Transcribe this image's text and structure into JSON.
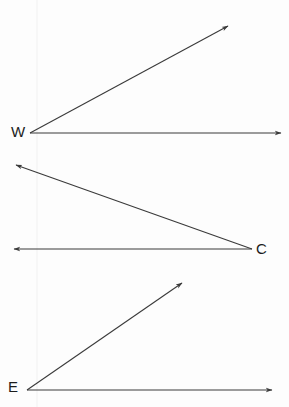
{
  "figure": {
    "background_color": "#fdfdfd",
    "stroke_color": "#3a3a3a",
    "label_color": "#1c1c1c",
    "width": 289,
    "height": 407
  },
  "angles": [
    {
      "id": "angle-w",
      "label": "W",
      "vertex": {
        "x": 30,
        "y": 133
      },
      "label_position": {
        "x": 11,
        "y": 124
      },
      "rays": [
        {
          "name": "upper-ray",
          "from": {
            "x": 30,
            "y": 133
          },
          "to": {
            "x": 228,
            "y": 26
          },
          "arrow_at": "to"
        },
        {
          "name": "horizontal-ray",
          "from": {
            "x": 30,
            "y": 133
          },
          "to": {
            "x": 281,
            "y": 133
          },
          "arrow_at": "to"
        }
      ]
    },
    {
      "id": "angle-c",
      "label": "C",
      "vertex": {
        "x": 252,
        "y": 249
      },
      "label_position": {
        "x": 256,
        "y": 241
      },
      "rays": [
        {
          "name": "upper-ray",
          "from": {
            "x": 252,
            "y": 249
          },
          "to": {
            "x": 16,
            "y": 165
          },
          "arrow_at": "to"
        },
        {
          "name": "horizontal-ray",
          "from": {
            "x": 252,
            "y": 249
          },
          "to": {
            "x": 14,
            "y": 249
          },
          "arrow_at": "to"
        }
      ]
    },
    {
      "id": "angle-e",
      "label": "E",
      "vertex": {
        "x": 27,
        "y": 390
      },
      "label_position": {
        "x": 8,
        "y": 379
      },
      "rays": [
        {
          "name": "upper-ray",
          "from": {
            "x": 27,
            "y": 390
          },
          "to": {
            "x": 182,
            "y": 283
          },
          "arrow_at": "to"
        },
        {
          "name": "horizontal-ray",
          "from": {
            "x": 27,
            "y": 390
          },
          "to": {
            "x": 272,
            "y": 390
          },
          "arrow_at": "to"
        }
      ]
    }
  ],
  "artifacts": [
    {
      "name": "faint-vertical-scan-line",
      "from": {
        "x": 37,
        "y": 0
      },
      "to": {
        "x": 37,
        "y": 407
      },
      "color": "#f1f1f1"
    }
  ]
}
